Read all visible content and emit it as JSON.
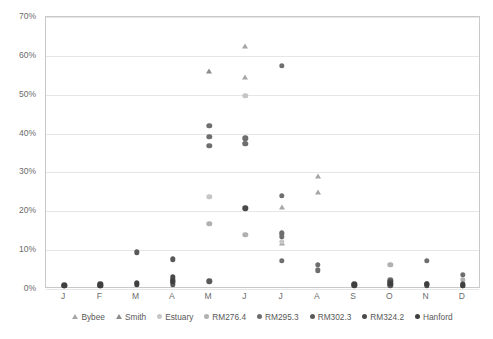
{
  "chart_data": {
    "type": "scatter",
    "title": "",
    "xlabel": "",
    "ylabel": "",
    "ylim": [
      0,
      0.7
    ],
    "ytick_labels": [
      "0%",
      "10%",
      "20%",
      "30%",
      "40%",
      "50%",
      "60%",
      "70%"
    ],
    "ytick_values": [
      0,
      0.1,
      0.2,
      0.3,
      0.4,
      0.5,
      0.6,
      0.7
    ],
    "categories": [
      "J",
      "F",
      "M",
      "A",
      "M",
      "J",
      "J",
      "A",
      "S",
      "O",
      "N",
      "D"
    ],
    "grid": true,
    "legend_position": "bottom",
    "series": [
      {
        "name": "Bybee",
        "marker": "triangle",
        "color": "#a6a6a6",
        "points": [
          {
            "x": "J",
            "y": 0.625
          },
          {
            "x": "J",
            "y": 0.545
          },
          {
            "x": "J",
            "y": 0.212
          },
          {
            "x": "J",
            "y": 0.118
          },
          {
            "x": "A",
            "y": 0.291
          },
          {
            "x": "A",
            "y": 0.249
          }
        ]
      },
      {
        "name": "Smith",
        "marker": "triangle",
        "color": "#8c8c8c",
        "points": [
          {
            "x": "M",
            "y": 0.56
          },
          {
            "x": "J",
            "y": 0.381
          }
        ]
      },
      {
        "name": "Estuary",
        "marker": "circle",
        "color": "#c6c6c6",
        "points": [
          {
            "x": "J",
            "y": 0.497
          },
          {
            "x": "J",
            "y": 0.122
          },
          {
            "x": "M",
            "y": 0.237
          }
        ]
      },
      {
        "name": "RM276.4",
        "marker": "circle",
        "color": "#b0b0b0",
        "points": [
          {
            "x": "M",
            "y": 0.168
          },
          {
            "x": "J",
            "y": 0.14
          },
          {
            "x": "J",
            "y": 0.142
          },
          {
            "x": "O",
            "y": 0.062
          },
          {
            "x": "D",
            "y": 0.024
          }
        ]
      },
      {
        "name": "RM295.3",
        "marker": "circle",
        "color": "#6e6e6e",
        "points": [
          {
            "x": "J",
            "y": 0.575
          },
          {
            "x": "M",
            "y": 0.42
          },
          {
            "x": "M",
            "y": 0.392
          },
          {
            "x": "M",
            "y": 0.368
          },
          {
            "x": "J",
            "y": 0.388
          },
          {
            "x": "J",
            "y": 0.373
          },
          {
            "x": "J",
            "y": 0.24
          },
          {
            "x": "J",
            "y": 0.143
          },
          {
            "x": "J",
            "y": 0.135
          },
          {
            "x": "J",
            "y": 0.072
          },
          {
            "x": "A",
            "y": 0.063
          },
          {
            "x": "A",
            "y": 0.048
          },
          {
            "x": "O",
            "y": 0.022
          },
          {
            "x": "N",
            "y": 0.072
          },
          {
            "x": "D",
            "y": 0.036
          }
        ]
      },
      {
        "name": "RM302.3",
        "marker": "circle",
        "color": "#595959",
        "points": [
          {
            "x": "M",
            "y": 0.094
          },
          {
            "x": "A",
            "y": 0.076
          },
          {
            "x": "A",
            "y": 0.018
          },
          {
            "x": "A",
            "y": 0.012
          },
          {
            "x": "M",
            "y": 0.02
          },
          {
            "x": "O",
            "y": 0.01
          },
          {
            "x": "N",
            "y": 0.012
          },
          {
            "x": "D",
            "y": 0.014
          }
        ]
      },
      {
        "name": "RM324.2",
        "marker": "circle",
        "color": "#4a4a4a",
        "points": [
          {
            "x": "J",
            "y": 0.01
          },
          {
            "x": "F",
            "y": 0.013
          },
          {
            "x": "F",
            "y": 0.008
          },
          {
            "x": "M",
            "y": 0.016
          },
          {
            "x": "A",
            "y": 0.03
          },
          {
            "x": "A",
            "y": 0.024
          },
          {
            "x": "J",
            "y": 0.208
          },
          {
            "x": "S",
            "y": 0.012
          },
          {
            "x": "O",
            "y": 0.018
          },
          {
            "x": "N",
            "y": 0.01
          },
          {
            "x": "D",
            "y": 0.008
          }
        ]
      },
      {
        "name": "Hanford",
        "marker": "circle",
        "color": "#3f3f3f",
        "points": [
          {
            "x": "J",
            "y": 0.008
          },
          {
            "x": "F",
            "y": 0.01
          },
          {
            "x": "M",
            "y": 0.012
          },
          {
            "x": "A",
            "y": 0.02
          },
          {
            "x": "S",
            "y": 0.01
          },
          {
            "x": "O",
            "y": 0.014
          },
          {
            "x": "N",
            "y": 0.014
          },
          {
            "x": "D",
            "y": 0.01
          }
        ]
      }
    ]
  }
}
